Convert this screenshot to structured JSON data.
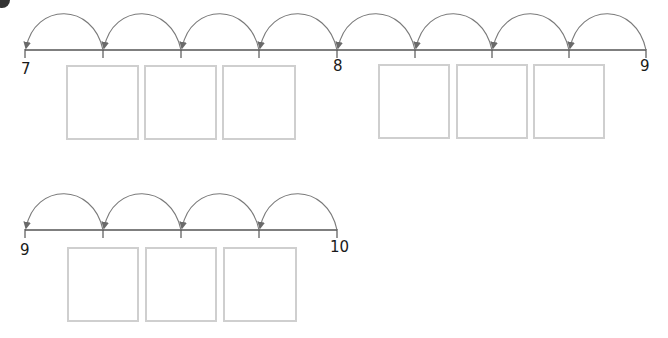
{
  "colors": {
    "line": "#555555",
    "arc": "#7a7a7a",
    "box_border": "#cfcfcf",
    "label": "#1a1a1a"
  },
  "number_lines": [
    {
      "start_label": "7",
      "mid_label": "8",
      "end_label": "9",
      "x_start": 25,
      "x_end": 646,
      "y": 50,
      "ticks": [
        25,
        103,
        181,
        259,
        337,
        415,
        492,
        569,
        646
      ],
      "hops": 8,
      "hop_direction": "right-to-left",
      "answer_boxes": [
        {
          "x": 66,
          "y": 65,
          "w": 73,
          "h": 75,
          "value": ""
        },
        {
          "x": 144,
          "y": 65,
          "w": 73,
          "h": 75,
          "value": ""
        },
        {
          "x": 222,
          "y": 65,
          "w": 74,
          "h": 75,
          "value": ""
        },
        {
          "x": 378,
          "y": 64,
          "w": 72,
          "h": 75,
          "value": ""
        },
        {
          "x": 456,
          "y": 64,
          "w": 72,
          "h": 75,
          "value": ""
        },
        {
          "x": 533,
          "y": 64,
          "w": 72,
          "h": 75,
          "value": ""
        }
      ]
    },
    {
      "start_label": "9",
      "end_label": "10",
      "x_start": 25,
      "x_end": 337,
      "y": 230,
      "ticks": [
        25,
        103,
        181,
        259,
        337
      ],
      "hops": 4,
      "hop_direction": "right-to-left",
      "answer_boxes": [
        {
          "x": 67,
          "y": 247,
          "w": 72,
          "h": 75,
          "value": ""
        },
        {
          "x": 145,
          "y": 247,
          "w": 72,
          "h": 75,
          "value": ""
        },
        {
          "x": 223,
          "y": 247,
          "w": 74,
          "h": 75,
          "value": ""
        }
      ]
    }
  ]
}
